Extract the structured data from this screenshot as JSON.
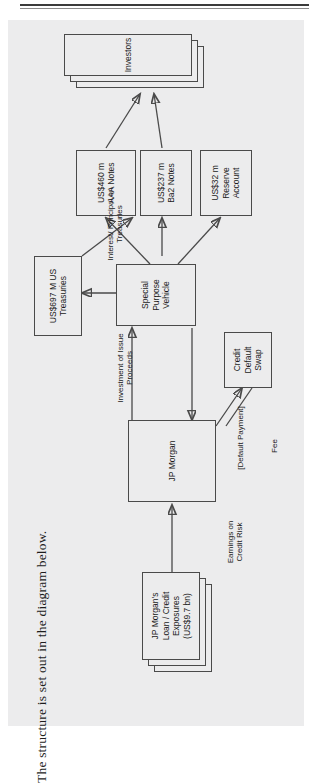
{
  "page": {
    "title_text": "The structure is set out in the diagram below."
  },
  "diagram": {
    "nodes": [
      {
        "id": "investors",
        "label": "Investors"
      },
      {
        "id": "aaa-notes",
        "label": "US$460 m\nAAA Notes"
      },
      {
        "id": "ba2-notes",
        "label": "US$237 m\nBa2 Notes"
      },
      {
        "id": "reserve-account",
        "label": "US$32 m\nReserve\nAccount"
      },
      {
        "id": "us-treasuries",
        "label": "US$697 M US\nTreasuries"
      },
      {
        "id": "spv",
        "label": "Special\nPurpose\nVehicle"
      },
      {
        "id": "jp-morgan",
        "label": "JP Morgan"
      },
      {
        "id": "credit-default-swap",
        "label": "Credit\nDefault\nSwap"
      },
      {
        "id": "loan-exposures",
        "label": "JP Morgan's\nLoan / Credit\nExposures\n(US$9.7 bn)"
      }
    ],
    "edge_labels": [
      {
        "id": "interest-principal",
        "label": "Interest/ Principal on\nTreasuries"
      },
      {
        "id": "investment-proceeds",
        "label": "Investment of Issue\nProceeds"
      },
      {
        "id": "default-payment",
        "label": "[Default Payment]"
      },
      {
        "id": "fee",
        "label": "Fee"
      },
      {
        "id": "earnings-credit-risk",
        "label": "Earnings on\nCredit Risk"
      }
    ]
  },
  "colors": {
    "paper": "#ececed",
    "ink": "#1b1b1b",
    "stroke": "#4a4a4a"
  }
}
